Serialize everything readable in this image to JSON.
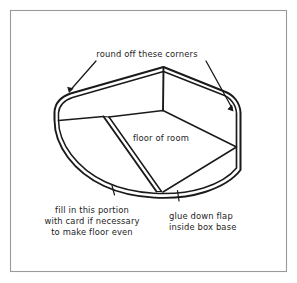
{
  "figure": {
    "title": "round off these corners",
    "frame_color": "#9a9a9a",
    "ink_color": "#1a1a1a",
    "background_color": "#ffffff",
    "annotations": {
      "top": {
        "name": "round-off-corners-note",
        "lines": [
          "round off these corners"
        ]
      },
      "center": {
        "name": "floor-of-room-label",
        "lines": [
          "floor of room"
        ]
      },
      "bottom_left": {
        "name": "fill-in-portion-note",
        "lines": [
          "fill in this portion",
          "with card if necessary",
          "to make floor even"
        ]
      },
      "bottom_right": {
        "name": "glue-down-flap-note",
        "lines": [
          "glue down flap",
          "inside box base"
        ]
      }
    },
    "parts": [
      {
        "name": "box-base-outer-wall",
        "description": "rounded rectangular box base drawn in perspective with double-line wall thickness"
      },
      {
        "name": "floor-panel",
        "description": "quadrilateral panel forming the floor of room"
      },
      {
        "name": "glue-flap-strip",
        "description": "narrow strip flap running down-left from floor panel"
      },
      {
        "name": "left-back-wall-edge",
        "description": "horizontal fold line at left of floor panel"
      },
      {
        "name": "apex-corner",
        "description": "rear top corner of the box"
      }
    ]
  }
}
